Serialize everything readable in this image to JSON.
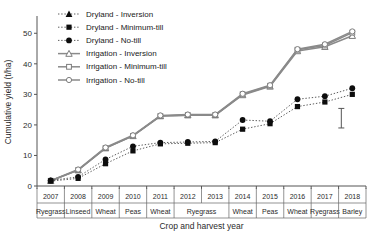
{
  "chart_data": {
    "type": "line",
    "title": "",
    "xlabel": "Crop and harvest year",
    "ylabel": "Cumulative yield (t/ha)",
    "ylim": [
      0,
      55
    ],
    "yticks": [
      0,
      10,
      20,
      30,
      40,
      50
    ],
    "grid": false,
    "legend_position": "top-left",
    "x": [
      "2007",
      "2008",
      "2009",
      "2010",
      "2011",
      "2012",
      "2013",
      "2014",
      "2015",
      "2016",
      "2017",
      "2018"
    ],
    "categories": [
      "2007",
      "2008",
      "2009",
      "2010",
      "2011",
      "2012",
      "2013",
      "2014",
      "2015",
      "2016",
      "2017",
      "2018"
    ],
    "x_crops": [
      "Ryegrass",
      "Linseed",
      "Wheat",
      "Peas",
      "Wheat",
      "Ryegrass",
      "Ryegrass",
      "Wheat",
      "Peas",
      "Wheat",
      "Ryegrass",
      "Barley"
    ],
    "x_crop_groups": [
      {
        "label": "Ryegrass",
        "span": 1
      },
      {
        "label": "Linseed",
        "span": 1
      },
      {
        "label": "Wheat",
        "span": 1
      },
      {
        "label": "Peas",
        "span": 1
      },
      {
        "label": "Wheat",
        "span": 1
      },
      {
        "label": "Ryegrass",
        "span": 2
      },
      {
        "label": "Wheat",
        "span": 1
      },
      {
        "label": "Peas",
        "span": 1
      },
      {
        "label": "Wheat",
        "span": 1
      },
      {
        "label": "Ryegrass",
        "span": 1
      },
      {
        "label": "Barley",
        "span": 1
      }
    ],
    "series": [
      {
        "name": "Dryland - Inversion",
        "marker": "triangle-filled",
        "line": "dotted",
        "color": "#0d0d0d",
        "values": [
          null,
          null,
          null,
          null,
          null,
          null,
          null,
          null,
          null,
          null,
          null,
          null
        ]
      },
      {
        "name": "Dryland - Minimum-till",
        "marker": "square-filled",
        "line": "dotted",
        "color": "#0d0d0d",
        "values": [
          1.6,
          2.5,
          7.3,
          11.5,
          13.8,
          14.0,
          14.2,
          18.6,
          20.4,
          26.0,
          27.5,
          30.0
        ]
      },
      {
        "name": "Dryland - No-till",
        "marker": "circle-filled",
        "line": "dotted",
        "color": "#0d0d0d",
        "values": [
          1.8,
          3.0,
          8.7,
          13.0,
          14.2,
          14.4,
          14.6,
          21.6,
          21.2,
          28.4,
          29.4,
          32.0
        ]
      },
      {
        "name": "Irrigation - Inversion",
        "marker": "triangle-open",
        "line": "solid",
        "color": "#8a8a8a",
        "values": [
          1.7,
          5.2,
          12.4,
          16.4,
          22.9,
          23.2,
          23.2,
          29.8,
          32.6,
          44.2,
          45.6,
          49.2
        ]
      },
      {
        "name": "Irrigation - Minimum-till",
        "marker": "square-open",
        "line": "solid",
        "color": "#8a8a8a",
        "values": [
          1.7,
          5.2,
          12.4,
          16.4,
          22.9,
          23.2,
          23.2,
          30.0,
          32.8,
          44.6,
          46.0,
          50.2
        ]
      },
      {
        "name": "Irrigation - No-till",
        "marker": "circle-open",
        "line": "solid",
        "color": "#8a8a8a",
        "values": [
          1.7,
          5.4,
          12.6,
          16.6,
          23.1,
          23.4,
          23.4,
          30.2,
          33.0,
          44.8,
          46.4,
          50.6
        ]
      }
    ],
    "error_bar": {
      "center": 22.0,
      "low": 19.0,
      "high": 25.4,
      "at_x_index": 10.6
    }
  },
  "legend": {
    "items": [
      {
        "label": "Dryland - Inversion"
      },
      {
        "label": "Dryland - Minimum-till"
      },
      {
        "label": "Dryland - No-till"
      },
      {
        "label": "Irrigation - Inversion"
      },
      {
        "label": "Irrigation - Minimum-till"
      },
      {
        "label": "Irrigation - No-till"
      }
    ]
  }
}
